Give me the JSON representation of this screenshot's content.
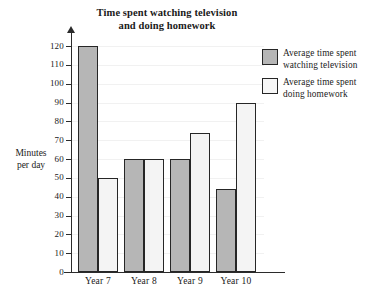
{
  "chart_data": {
    "type": "bar",
    "title": "Time spent watching television and doing homework",
    "title_line1": "Time spent watching television",
    "title_line2": "and doing homework",
    "xlabel": "",
    "ylabel": "Minutes per day",
    "ylabel_line1": "Minutes",
    "ylabel_line2": "per day",
    "categories": [
      "Year 7",
      "Year 8",
      "Year 9",
      "Year 10"
    ],
    "series": [
      {
        "name": "Average time spent watching television",
        "name_line1": "Average time spent",
        "name_line2": "watching television",
        "color": "#b6b6b6",
        "values": [
          120,
          60,
          60,
          44
        ]
      },
      {
        "name": "Average time spent doing homework",
        "name_line1": "Average time spent",
        "name_line2": "doing homework",
        "color": "#f4f4f4",
        "values": [
          50,
          60,
          74,
          90
        ]
      }
    ],
    "ylim": [
      0,
      120
    ],
    "ytick_step": 10,
    "yticks": [
      0,
      10,
      20,
      30,
      40,
      50,
      60,
      70,
      80,
      90,
      100,
      110,
      120
    ],
    "ytick_labels": [
      "0",
      "10",
      "20",
      "30",
      "40",
      "50",
      "60",
      "70",
      "80",
      "90",
      "100",
      "110",
      "120"
    ],
    "grid": true,
    "grid_axis": "y",
    "legend_position": "right",
    "axis_color": "#2b2b2b",
    "bar_border_color": "#262626",
    "background": "#ffffff"
  }
}
